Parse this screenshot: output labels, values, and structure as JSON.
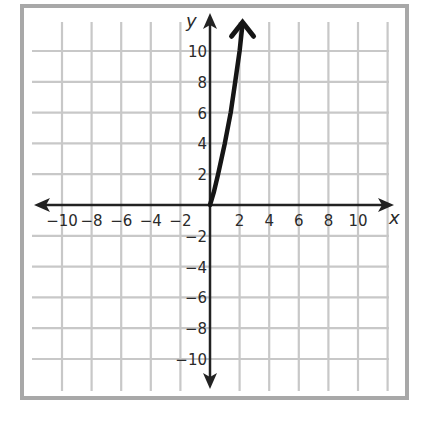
{
  "chart_data": {
    "type": "line",
    "title": "",
    "xlabel": "x",
    "ylabel": "y",
    "xlim": [
      -11,
      11
    ],
    "ylim": [
      -11,
      12
    ],
    "grid": true,
    "x_ticks": [
      -10,
      -8,
      -6,
      -4,
      -2,
      2,
      4,
      6,
      8,
      10
    ],
    "y_ticks": [
      10,
      8,
      6,
      4,
      2,
      -2,
      -4,
      -6,
      -8,
      -10
    ],
    "x_tick_labels": [
      "−10",
      "−8",
      "−6",
      "−4",
      "−2",
      "2",
      "4",
      "6",
      "8",
      "10"
    ],
    "y_tick_labels": [
      "10",
      "8",
      "6",
      "4",
      "2",
      "−2",
      "−4",
      "−6",
      "−8",
      "−10"
    ],
    "series": [
      {
        "name": "curve",
        "x": [
          0,
          0.25,
          0.55,
          1.0,
          1.4,
          1.7,
          2.0,
          2.2
        ],
        "y": [
          0,
          0.8,
          2,
          4,
          6,
          8,
          10,
          11.8
        ],
        "arrow_end": true,
        "domain": "x >= 0"
      }
    ],
    "colors": {
      "grid": "#c8c8c8",
      "axis": "#222222",
      "curve": "#151515",
      "frame": "#a8a8a8"
    }
  }
}
